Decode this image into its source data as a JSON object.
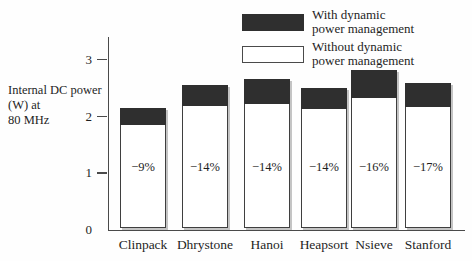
{
  "figure": {
    "ylabel_lines": [
      "Internal DC power",
      "(W) at",
      "80 MHz"
    ],
    "legend": {
      "items": [
        {
          "swatch": "dark",
          "lines": [
            "With dynamic",
            "power management"
          ]
        },
        {
          "swatch": "white",
          "lines": [
            "Without dynamic",
            "power management"
          ]
        }
      ]
    }
  },
  "chart_data": {
    "type": "bar",
    "stacked": true,
    "categories": [
      "Clinpack",
      "Dhrystone",
      "Hanoi",
      "Heapsort",
      "Nsieve",
      "Stanford"
    ],
    "series": [
      {
        "name": "Without dynamic power management",
        "role": "base-white",
        "values": [
          1.82,
          2.15,
          2.18,
          2.1,
          2.28,
          2.13
        ]
      },
      {
        "name": "With dynamic power management",
        "role": "top-dark",
        "values": [
          0.3,
          0.37,
          0.44,
          0.37,
          0.5,
          0.42
        ]
      }
    ],
    "stack_totals": [
      2.12,
      2.52,
      2.62,
      2.47,
      2.78,
      2.55
    ],
    "bar_labels": [
      "−9%",
      "−14%",
      "−14%",
      "−14%",
      "−16%",
      "−17%"
    ],
    "title": "",
    "xlabel": "",
    "ylabel": "Internal DC power (W) at 80 MHz",
    "ylim": [
      0,
      3.4
    ],
    "yticks": [
      0,
      1,
      2,
      3
    ],
    "grid": false,
    "legend_position": "top-right",
    "colors": {
      "with_dpm_fill": "#2f2f2f",
      "without_dpm_fill": "#ffffff",
      "bar_border": "#3f3f3f",
      "axis": "#4a4a4a",
      "text": "#1e1e1e",
      "shadow": "#c4c4c4"
    }
  }
}
